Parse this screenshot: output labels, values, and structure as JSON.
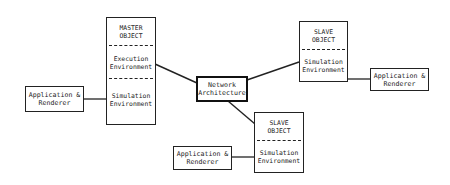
{
  "diagram": {
    "master": {
      "title_line1": "MASTER",
      "title_line2": "OBJECT",
      "section1_line1": "Execution",
      "section1_line2": "Environment",
      "section2_line1": "Simulation",
      "section2_line2": "Environment"
    },
    "network": {
      "line1": "Network",
      "line2": "Architecture"
    },
    "slave_top": {
      "title_line1": "SLAVE",
      "title_line2": "OBJECT",
      "section1_line1": "Simulation",
      "section1_line2": "Environment"
    },
    "slave_bottom": {
      "title_line1": "SLAVE",
      "title_line2": "OBJECT",
      "section1_line1": "Simulation",
      "section1_line2": "Environment"
    },
    "app_left": {
      "line1": "Application &",
      "line2": "Renderer"
    },
    "app_right": {
      "line1": "Application &",
      "line2": "Renderer"
    },
    "app_bottom": {
      "line1": "Application &",
      "line2": "Renderer"
    },
    "colors": {
      "line": "#222222",
      "background": "#ffffff"
    }
  }
}
